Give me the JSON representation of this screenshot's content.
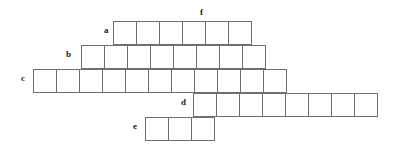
{
  "figure": {
    "kind": "crossword-skeleton-grid",
    "cell_size": 24,
    "line_color": "#6f6f6f",
    "label_color": "#1a1a1a",
    "background": "#ffffff",
    "width": 393,
    "height": 149
  },
  "labels": {
    "a": "a",
    "b": "b",
    "c": "c",
    "d": "d",
    "e": "e",
    "f": "f"
  },
  "rows": [
    {
      "id": "a",
      "label": "a",
      "cells": 6,
      "left": 113,
      "top": 21,
      "label_x": 104,
      "label_y": 26
    },
    {
      "id": "b",
      "label": "b",
      "cells": 8,
      "left": 81,
      "top": 45,
      "label_x": 66,
      "label_y": 50
    },
    {
      "id": "c",
      "label": "c",
      "cells": 11,
      "left": 33,
      "top": 69,
      "label_x": 21,
      "label_y": 74
    },
    {
      "id": "d",
      "label": "d",
      "cells": 8,
      "left": 193,
      "top": 93,
      "label_x": 181,
      "label_y": 98
    },
    {
      "id": "e",
      "label": "e",
      "cells": 3,
      "left": 145,
      "top": 117,
      "label_x": 133,
      "label_y": 122
    }
  ],
  "columns": [
    {
      "id": "f",
      "label": "f",
      "label_x": 200,
      "label_y": 8
    }
  ],
  "cell_values": {
    "a": [
      "",
      "",
      "",
      "",
      "",
      ""
    ],
    "b": [
      "",
      "",
      "",
      "",
      "",
      "",
      "",
      ""
    ],
    "c": [
      "",
      "",
      "",
      "",
      "",
      "",
      "",
      "",
      "",
      "",
      ""
    ],
    "d": [
      "",
      "",
      "",
      "",
      "",
      "",
      "",
      ""
    ],
    "e": [
      "",
      "",
      ""
    ]
  }
}
